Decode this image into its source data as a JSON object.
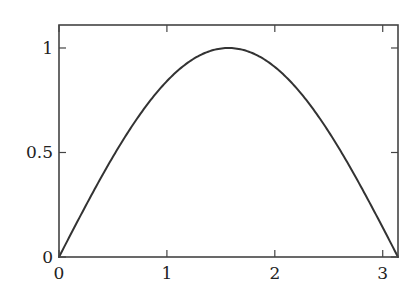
{
  "chart_data": {
    "type": "line",
    "title": "",
    "xlabel": "",
    "ylabel": "",
    "xlim": [
      0,
      3.14159
    ],
    "ylim": [
      0,
      1.11
    ],
    "grid": false,
    "legend": null,
    "function": "sin(x)",
    "series": [
      {
        "name": "sin(x)",
        "color": "#333333",
        "x": [
          0,
          0.1571,
          0.3142,
          0.4712,
          0.6283,
          0.7854,
          0.9425,
          1.0996,
          1.2566,
          1.4137,
          1.5708,
          1.7279,
          1.885,
          2.042,
          2.1991,
          2.3562,
          2.5133,
          2.6704,
          2.8274,
          2.9845,
          3.1416
        ],
        "y": [
          0,
          0.1564,
          0.309,
          0.454,
          0.5878,
          0.7071,
          0.809,
          0.891,
          0.9511,
          0.9877,
          1.0,
          0.9877,
          0.9511,
          0.891,
          0.809,
          0.7071,
          0.5878,
          0.454,
          0.309,
          0.1564,
          0
        ]
      }
    ],
    "x_ticks": [
      {
        "value": 0,
        "label": "0"
      },
      {
        "value": 1,
        "label": "1"
      },
      {
        "value": 2,
        "label": "2"
      },
      {
        "value": 3,
        "label": "3"
      }
    ],
    "y_ticks": [
      {
        "value": 0,
        "label": "0"
      },
      {
        "value": 0.5,
        "label": "0.5"
      },
      {
        "value": 1,
        "label": "1"
      }
    ]
  }
}
